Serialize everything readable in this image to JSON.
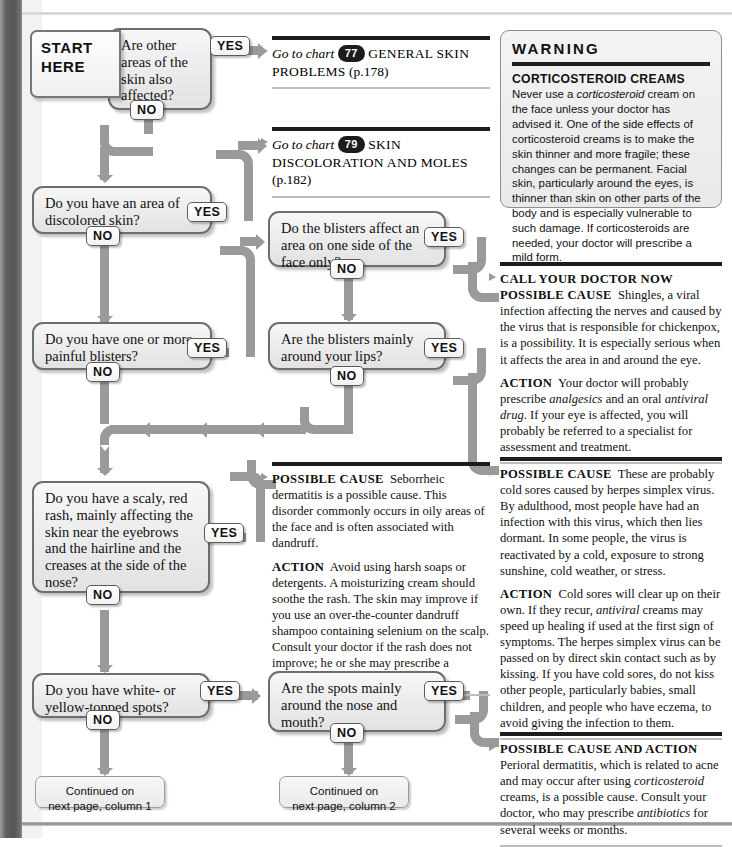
{
  "flow": {
    "start_label_line1": "START",
    "start_label_line2": "HERE",
    "yes": "YES",
    "no": "NO",
    "questions": {
      "q1": "Are other areas of the skin also affected?",
      "q2": "Do you have an area of discolored skin?",
      "q3": "Do you have one or more painful blisters?",
      "q4": "Do the blisters affect an area on one side of the face only?",
      "q5": "Are the blisters mainly around your lips?",
      "q6": "Do you have a scaly, red rash, mainly affecting the skin near the eyebrows and the hairline and the creases at the side of the nose?",
      "q7": "Do you have white- or yellow-topped spots?",
      "q8": "Are the spots mainly around the nose and mouth?"
    },
    "continued_1": "Continued on\nnext page, column 1",
    "continued_2": "Continued on\nnext page, column 2"
  },
  "goto": {
    "ref1": {
      "lead": "Go to chart",
      "number": "77",
      "title": "GENERAL SKIN PROBLEMS",
      "page": "(p.178)"
    },
    "ref2": {
      "lead": "Go to chart",
      "number": "79",
      "title": "SKIN DISCOLORATION AND MOLES",
      "page": "(p.182)"
    }
  },
  "warning": {
    "heading": "WARNING",
    "term": "CORTICOSTEROID CREAMS",
    "body_1": "Never use a ",
    "body_em": "corticosteroid",
    "body_2": " cream on the face unless your doctor has advised it. One of the side effects of corticosteroid creams is to make the skin thinner and more fragile; these changes can be permanent. Facial skin, particularly around the eyes, is thinner than skin on other parts of the body and is especially vulnerable to such damage. If corticosteroids are needed, your doctor will prescribe a mild form."
  },
  "advice": {
    "doctor_now": {
      "heading": "CALL YOUR DOCTOR NOW",
      "cause_label": "POSSIBLE CAUSE",
      "cause_text": "Shingles, a viral infection affecting the nerves and caused by the virus that is responsible for chickenpox, is a possibility. It is especially serious when it affects the area in and around the eye.",
      "action_label": "ACTION",
      "action_pre": "Your doctor will probably prescribe ",
      "action_em1": "analgesics",
      "action_mid": " and an oral ",
      "action_em2": "antiviral drug",
      "action_post": ". If your eye is affected, you will probably be referred to a specialist for assessment and treatment."
    },
    "seborrheic": {
      "cause_label": "POSSIBLE CAUSE",
      "cause_text": "Seborrheic dermatitis is a possible cause. This disorder commonly occurs in oily areas of the face and is often associated with dandruff.",
      "action_label": "ACTION",
      "action_pre": "Avoid using harsh soaps or detergents. A moisturizing cream should soothe the rash. The skin may improve if you use an over-the-counter dandruff shampoo containing selenium on the scalp. Consult your doctor if the rash does not improve; he or she may prescribe a ",
      "action_em": "corticosteroid",
      "action_post": " cream."
    },
    "cold_sores": {
      "cause_label": "POSSIBLE CAUSE",
      "cause_text": "These are probably cold sores caused by herpes simplex virus. By adulthood, most people have had an infection with this virus, which then lies dormant. In some people, the virus is reactivated by a cold, exposure to strong sunshine, cold weather, or stress.",
      "action_label": "ACTION",
      "action_pre": "Cold sores will clear up on their own. If they recur, ",
      "action_em": "antiviral",
      "action_post": " creams may speed up healing if used at the first sign of symptoms. The herpes simplex virus can be passed on by direct skin contact such as by kissing. If you have cold sores, do not kiss other people, particularly babies, small children, and people who have eczema, to avoid giving the infection to them."
    },
    "perioral": {
      "cause_label": "POSSIBLE CAUSE AND ACTION",
      "text_pre": "Perioral dermatitis, which is related to acne and may occur after using ",
      "em1": "corticosteroid",
      "text_mid": " creams, is a possible cause. Consult your doctor, who may prescribe ",
      "em2": "antibiotics",
      "text_post": " for several weeks or months."
    }
  },
  "colors": {
    "connector": "#9a9a9a",
    "rule_dark": "#1c1c1c",
    "box_border": "#6d6d6d",
    "gutter": "#555555"
  }
}
